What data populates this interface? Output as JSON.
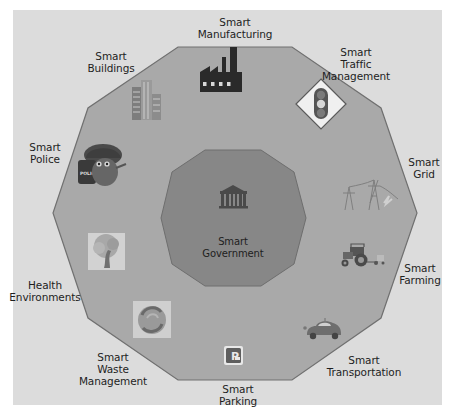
{
  "diagram": {
    "type": "smart-city-decagon",
    "colors": {
      "background": "#dcdcdc",
      "outer_polygon": "#a9a9a9",
      "outer_border": "#707070",
      "inner_polygon": "#878787",
      "inner_border": "#6a6a6a",
      "text": "#1e1e1e"
    },
    "center": {
      "line1": "Smart",
      "line2": "Government",
      "icon": "government-building-icon"
    },
    "nodes": [
      {
        "id": "manufacturing",
        "line1": "Smart",
        "line2": "Manufacturing",
        "line3": "",
        "icon": "factory-icon"
      },
      {
        "id": "traffic",
        "line1": "Smart",
        "line2": "Traffic",
        "line3": "Management",
        "icon": "traffic-light-icon"
      },
      {
        "id": "grid",
        "line1": "Smart",
        "line2": "Grid",
        "line3": "",
        "icon": "power-tower-icon"
      },
      {
        "id": "farming",
        "line1": "Smart",
        "line2": "Farming",
        "line3": "",
        "icon": "tractor-icon"
      },
      {
        "id": "transportation",
        "line1": "Smart",
        "line2": "Transportation",
        "line3": "",
        "icon": "car-icon"
      },
      {
        "id": "parking",
        "line1": "Smart",
        "line2": "Parking",
        "line3": "",
        "icon": "parking-icon",
        "icon_text": "P"
      },
      {
        "id": "waste",
        "line1": "Smart",
        "line2": "Waste",
        "line3": "Management",
        "icon": "recycle-icon"
      },
      {
        "id": "health",
        "line1": "Health",
        "line2": "Environments",
        "line3": "",
        "icon": "tree-icon"
      },
      {
        "id": "police",
        "line1": "Smart",
        "line2": "Police",
        "line3": "",
        "icon": "police-mascot-icon",
        "icon_text": "POLICE"
      },
      {
        "id": "buildings",
        "line1": "Smart",
        "line2": "Buildings",
        "line3": "",
        "icon": "office-building-icon"
      }
    ]
  }
}
